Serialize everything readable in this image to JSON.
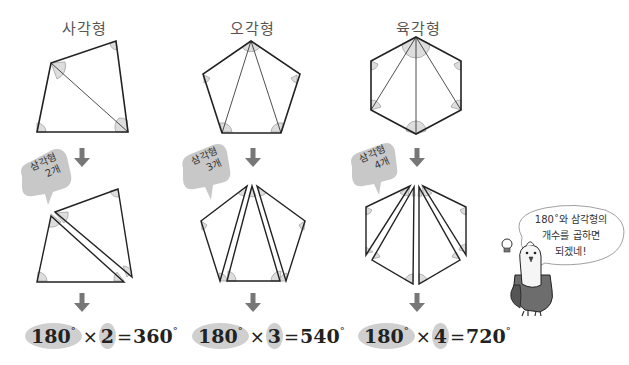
{
  "columns": [
    {
      "title": "사각형",
      "badge": {
        "line1": "삼각형",
        "line2": "2개"
      },
      "formula": {
        "base": "180",
        "degree": "°",
        "times": "×",
        "count": "2",
        "equals": "=",
        "result": "360"
      }
    },
    {
      "title": "오각형",
      "badge": {
        "line1": "삼각형",
        "line2": "3개"
      },
      "formula": {
        "base": "180",
        "degree": "°",
        "times": "×",
        "count": "3",
        "equals": "=",
        "result": "540"
      }
    },
    {
      "title": "육각형",
      "badge": {
        "line1": "삼각형",
        "line2": "4개"
      },
      "formula": {
        "base": "180",
        "degree": "°",
        "times": "×",
        "count": "4",
        "equals": "=",
        "result": "720"
      }
    }
  ],
  "speech_bubble": {
    "line1": "180˚와 삼각형의",
    "line2": "개수를 곱하면",
    "line3": "되겠네!"
  },
  "colors": {
    "arrow": "#777777",
    "badge_bg": "#c8c8c8",
    "highlight": "#cfcfcf",
    "angle_fill": "#dddddd",
    "line": "#222222"
  }
}
